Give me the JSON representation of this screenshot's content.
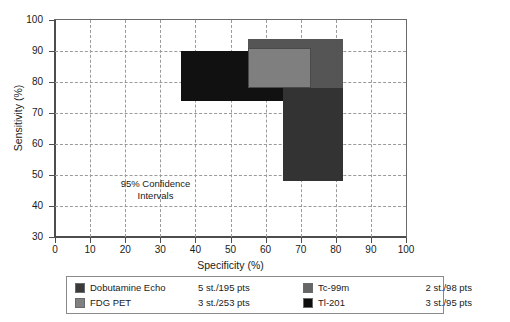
{
  "chart_data": {
    "type": "scatter",
    "title": "",
    "xlabel": "Specificity (%)",
    "ylabel": "Sensitivity (%)",
    "xlim": [
      0,
      100
    ],
    "ylim": [
      30,
      100
    ],
    "xticks": [
      0,
      10,
      20,
      30,
      40,
      50,
      60,
      70,
      80,
      90,
      100
    ],
    "yticks": [
      30,
      40,
      50,
      60,
      70,
      80,
      90,
      100
    ],
    "grid": true,
    "legend_position": "below-plot",
    "annotation": "95% Confidence Intervals",
    "annotation_line1": "95% Confidence",
    "annotation_line2": "Intervals",
    "series": [
      {
        "name": "Dobutamine Echo",
        "studies": "5 st./195 pts",
        "color": "#111111",
        "specificity_range": [
          36,
          71
        ],
        "sensitivity_range": [
          74,
          90
        ]
      },
      {
        "name": "FDG PET",
        "studies": "3 st./253 pts",
        "color": "#7f7f7f",
        "specificity_range": [
          55,
          73
        ],
        "sensitivity_range": [
          78,
          91
        ]
      },
      {
        "name": "Tc-99m",
        "studies": "2 st./98 pts",
        "color": "#555555",
        "specificity_range": [
          55,
          82
        ],
        "sensitivity_range": [
          75,
          94
        ]
      },
      {
        "name": "Tl-201",
        "studies": "3 st./95 pts",
        "color": "#333333",
        "specificity_range": [
          65,
          82
        ],
        "sensitivity_range": [
          48,
          78
        ]
      }
    ]
  },
  "axes": {
    "x_title": "Specificity (%)",
    "y_title": "Sensitivity (%)",
    "x_labels": [
      "0",
      "10",
      "20",
      "30",
      "40",
      "50",
      "60",
      "70",
      "80",
      "90",
      "100"
    ],
    "y_labels": [
      "100",
      "90",
      "80",
      "70",
      "60",
      "50",
      "40",
      "30"
    ]
  },
  "annotation": {
    "line1": "95% Confidence",
    "line2": "Intervals"
  },
  "legend": {
    "entries": [
      {
        "label": "Dobutamine Echo",
        "stats": "5 st./195 pts",
        "color": "#3a3a3a"
      },
      {
        "label": "FDG PET",
        "stats": "3 st./253 pts",
        "color": "#808080"
      },
      {
        "label": "Tc-99m",
        "stats": "2 st./98 pts",
        "color": "#666666"
      },
      {
        "label": "Tl-201",
        "stats": "3 st./95 pts",
        "color": "#0d0d0d"
      }
    ]
  },
  "colors": {
    "background": "#ffffff",
    "axis": "#4d4d4d",
    "grid": "#9a9a9a",
    "text": "#1a1a1a",
    "legend_border": "#8a8a8a"
  }
}
